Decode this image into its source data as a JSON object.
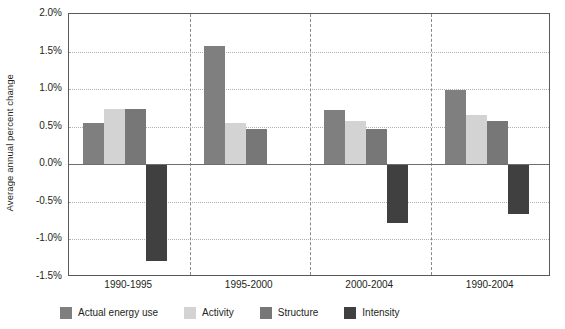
{
  "chart_data": {
    "type": "bar",
    "title": "",
    "subtitle": "",
    "xlabel": "",
    "ylabel": "Average annual percent change",
    "categories": [
      "1990-1995",
      "1995-2000",
      "2000-2004",
      "1990-2004"
    ],
    "series": [
      {
        "name": "Actual energy use",
        "color": "#807f80",
        "values": [
          0.55,
          1.57,
          0.72,
          0.99
        ]
      },
      {
        "name": "Activity",
        "color": "#d4d3d3",
        "values": [
          0.74,
          0.55,
          0.57,
          0.65
        ]
      },
      {
        "name": "Structure",
        "color": "#787778",
        "values": [
          0.74,
          0.47,
          0.47,
          0.57
        ]
      },
      {
        "name": "Intensity",
        "color": "#404040",
        "values": [
          -1.29,
          0.0,
          -0.78,
          -0.66
        ]
      }
    ],
    "ylim": [
      -1.5,
      2.0
    ],
    "ytick_values": [
      2.0,
      1.5,
      1.0,
      0.5,
      0.0,
      -0.5,
      -1.0,
      -1.5
    ],
    "ytick_labels": [
      "2.0%",
      "1.5%",
      "1.0%",
      "0.5%",
      "0.0%",
      "-0.5%",
      "-1.0%",
      "-1.5%"
    ],
    "grid": true,
    "grid_axis": "y",
    "legend_position": "bottom",
    "group_dividers": true,
    "zero_line": true,
    "colors": {
      "axis": "#58595b",
      "gridline": "#b0aeae",
      "zero_line": "#6d6e70",
      "divider": "#8a8a8a",
      "text": "#231f20",
      "background": "#ffffff"
    }
  }
}
